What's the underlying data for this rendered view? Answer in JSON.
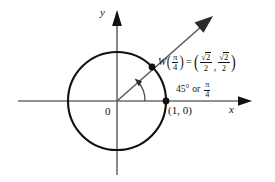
{
  "figure": {
    "axes": {
      "x_label": "x",
      "y_label": "y",
      "origin_label": "0"
    },
    "colors": {
      "axis": "#666666",
      "circle": "#111111",
      "ray": "#555555",
      "text": "#111111",
      "background": "#ffffff"
    },
    "labels": {
      "point_on_x_axis": "(1, 0)",
      "W_function_name": "W",
      "W_arg_numerator": "π",
      "W_arg_denominator": "4",
      "equals": "=",
      "coord_x_numerator_radical": "2",
      "coord_x_denominator": "2",
      "coord_y_numerator_radical": "2",
      "coord_y_denominator": "2",
      "coord_separator": ",",
      "angle_degrees": "45°",
      "angle_or": "or",
      "angle_rad_numerator": "π",
      "angle_rad_denominator": "4"
    },
    "geometry": {
      "center_x": 117,
      "center_y": 101,
      "radius": 49,
      "angle_degrees": 45,
      "terminal_point_x": 152,
      "terminal_point_y": 67,
      "unit_point_x": 166,
      "unit_point_y": 101,
      "ray_tip_x": 213,
      "ray_tip_y": 16
    }
  }
}
